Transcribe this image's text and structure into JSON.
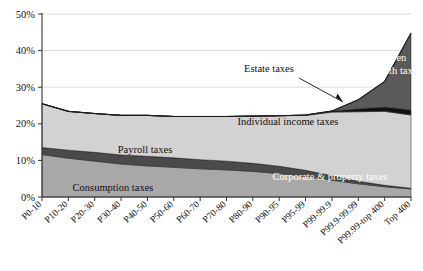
{
  "chart_data": {
    "type": "area",
    "title": "",
    "subtitle": "",
    "xlabel": "",
    "ylabel": "",
    "ylim": [
      0,
      50
    ],
    "yticks": [
      "0%",
      "10%",
      "20%",
      "30%",
      "40%",
      "50%"
    ],
    "ytick_values": [
      0,
      10,
      20,
      30,
      40,
      50
    ],
    "grid": true,
    "legend_position": "inline-labels",
    "stacked": true,
    "categories": [
      "P0-10",
      "P10-20",
      "P20-30",
      "P30-40",
      "P40-50",
      "P50-60",
      "P60-70",
      "P70-80",
      "P80-90",
      "P90-95",
      "P95-99",
      "P99-99.9",
      "P99.9-99.99",
      "P99.99-top 400",
      "Top 400"
    ],
    "series": [
      {
        "name": "Consumption taxes",
        "color": "#a8a8a8",
        "values": [
          11.6,
          10.6,
          9.8,
          9.0,
          8.5,
          8.1,
          7.7,
          7.4,
          7.0,
          6.4,
          5.6,
          4.6,
          3.6,
          2.8,
          2.2
        ]
      },
      {
        "name": "Payroll taxes",
        "color": "#4a4a4a",
        "values": [
          1.9,
          2.2,
          2.4,
          2.5,
          2.6,
          2.6,
          2.5,
          2.4,
          2.2,
          2.0,
          1.7,
          1.2,
          0.7,
          0.4,
          0.2
        ]
      },
      {
        "name": "Corporate & property taxes",
        "color": "#3b3b3b",
        "values": [
          0.0,
          0.0,
          0.0,
          0.0,
          0.0,
          0.0,
          0.0,
          0.0,
          0.0,
          0.0,
          0.0,
          0.0,
          0.0,
          0.0,
          0.0
        ]
      },
      {
        "name": "Individual income taxes",
        "color": "#d2d2d2",
        "values": [
          12.0,
          10.6,
          10.6,
          10.8,
          11.2,
          11.3,
          11.8,
          12.2,
          12.9,
          13.8,
          15.0,
          17.4,
          19.0,
          20.2,
          20.0
        ]
      },
      {
        "name": "Estate taxes",
        "color": "#111111",
        "values": [
          0.0,
          0.0,
          0.0,
          0.0,
          0.0,
          0.0,
          0.0,
          0.0,
          0.0,
          0.0,
          0.1,
          0.3,
          0.8,
          1.2,
          1.4
        ]
      },
      {
        "name": "Warren wealth tax",
        "color": "#5a5a5a",
        "values": [
          0.0,
          0.0,
          0.0,
          0.0,
          0.0,
          0.0,
          0.0,
          0.0,
          0.0,
          0.0,
          0.0,
          0.0,
          2.5,
          7.0,
          21.0
        ]
      }
    ],
    "annotations": [
      {
        "text": "Estate taxes",
        "x_px": 245,
        "y_px": 70
      }
    ],
    "inline_labels": [
      {
        "text": "Warren wealth tax",
        "style": "light"
      },
      {
        "text": "Individual income taxes",
        "style": "dark"
      },
      {
        "text": "Payroll taxes",
        "style": "dark"
      },
      {
        "text": "Consumption taxes",
        "style": "dark"
      },
      {
        "text": "Corporate & property taxes",
        "style": "light"
      }
    ]
  },
  "labels": {
    "warren": "Warren wealth tax",
    "warren_line1": "Warren",
    "warren_line2": "wealth tax",
    "individual": "Individual income taxes",
    "payroll": "Payroll taxes",
    "consumption": "Consumption taxes",
    "corporate": "Corporate & property taxes",
    "estate": "Estate taxes"
  },
  "yticks": {
    "t0": "0%",
    "t1": "10%",
    "t2": "20%",
    "t3": "30%",
    "t4": "40%",
    "t5": "50%"
  },
  "xticks": {
    "x0": "P0-10",
    "x1": "P10-20",
    "x2": "P20-30",
    "x3": "P30-40",
    "x4": "P40-50",
    "x5": "P50-60",
    "x6": "P60-70",
    "x7": "P70-80",
    "x8": "P80-90",
    "x9": "P90-95",
    "x10": "P95-99",
    "x11": "P99-99.9",
    "x12": "P99.9-99.99",
    "x13": "P99.99-top 400",
    "x14": "Top 400"
  },
  "colors": {
    "consumption": "#a8a8a8",
    "payroll": "#4a4a4a",
    "corporate": "#3b3b3b",
    "individual": "#d2d2d2",
    "estate": "#111111",
    "warren": "#5a5a5a",
    "grid": "#cccccc",
    "axis": "#333333"
  }
}
